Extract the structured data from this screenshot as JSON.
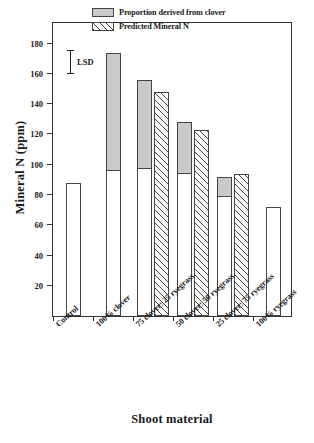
{
  "chart_data": {
    "type": "bar",
    "title": "",
    "xlabel": "Shoot material",
    "ylabel": "Mineral N (ppm)",
    "ylim": [
      0,
      195
    ],
    "yticks": [
      20,
      40,
      60,
      80,
      100,
      120,
      140,
      160,
      180
    ],
    "grid": false,
    "legend_position": "top-right",
    "categories": [
      "Control",
      "100% clover",
      "75 clover: 25 ryegrass",
      "50 clover: 50 ryegrass",
      "25 clover: 75 ryegrass",
      "100% ryegrass"
    ],
    "series": [
      {
        "name": "Measured Mineral N",
        "style": "white",
        "values": [
          88,
          174,
          156,
          128,
          92,
          72
        ]
      },
      {
        "name": "Proportion derived from clover",
        "style": "grey",
        "note": "Upper shaded portion of the measured bar; value is the base of the shaded segment",
        "base_values": [
          null,
          96,
          97,
          94,
          79,
          null
        ],
        "shaded_amounts": [
          null,
          78,
          59,
          34,
          13,
          null
        ]
      },
      {
        "name": "Predicted Mineral N",
        "style": "hatched",
        "values": [
          null,
          null,
          148,
          123,
          94,
          null
        ]
      }
    ],
    "annotations": [
      {
        "label": "LSD",
        "type": "error-bar",
        "from": 160,
        "to": 176
      }
    ]
  },
  "legend": {
    "items": [
      {
        "label": "Proportion derived from clover",
        "swatch": "grey-swatch"
      },
      {
        "label": "Predicted Mineral N",
        "swatch": "hatched-swatch"
      }
    ]
  },
  "axes": {
    "y_title": "Mineral N (ppm)",
    "x_title": "Shoot material",
    "y_tick_labels": [
      "180",
      "160",
      "140",
      "120",
      "100",
      "80",
      "60",
      "40",
      "20"
    ]
  },
  "annotation": {
    "lsd_label": "LSD"
  },
  "colors": {
    "clover_fill": "#c9c9c9",
    "bar_outline": "#444444",
    "axis": "#333333",
    "background": "#ffffff"
  }
}
